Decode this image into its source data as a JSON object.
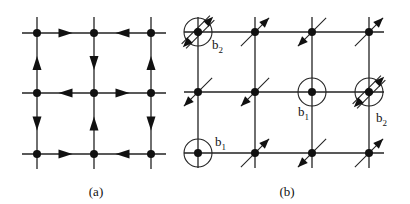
{
  "figure": {
    "panels": [
      {
        "id": "a",
        "caption": "(a)",
        "grid": {
          "cols_x": [
            37,
            94,
            151
          ],
          "rows_y": [
            33,
            93,
            154
          ],
          "line_extent_x": [
            22,
            166
          ],
          "line_extent_y": [
            17,
            169
          ]
        },
        "edges": [
          {
            "from": [
              0,
              0
            ],
            "to": [
              1,
              0
            ],
            "dir": "right"
          },
          {
            "from": [
              1,
              0
            ],
            "to": [
              2,
              0
            ],
            "dir": "left"
          },
          {
            "from": [
              0,
              1
            ],
            "to": [
              1,
              1
            ],
            "dir": "left"
          },
          {
            "from": [
              1,
              1
            ],
            "to": [
              2,
              1
            ],
            "dir": "right"
          },
          {
            "from": [
              0,
              2
            ],
            "to": [
              1,
              2
            ],
            "dir": "right"
          },
          {
            "from": [
              1,
              2
            ],
            "to": [
              2,
              2
            ],
            "dir": "left"
          },
          {
            "from": [
              0,
              0
            ],
            "to": [
              0,
              1
            ],
            "dir": "up"
          },
          {
            "from": [
              0,
              1
            ],
            "to": [
              0,
              2
            ],
            "dir": "down"
          },
          {
            "from": [
              1,
              0
            ],
            "to": [
              1,
              1
            ],
            "dir": "down"
          },
          {
            "from": [
              1,
              1
            ],
            "to": [
              1,
              2
            ],
            "dir": "up"
          },
          {
            "from": [
              2,
              0
            ],
            "to": [
              2,
              1
            ],
            "dir": "up"
          },
          {
            "from": [
              2,
              1
            ],
            "to": [
              2,
              2
            ],
            "dir": "down"
          }
        ]
      },
      {
        "id": "b",
        "caption": "(b)",
        "grid": {
          "cols_x": [
            198,
            255,
            312,
            369
          ],
          "rows_y": [
            32,
            92,
            153
          ],
          "line_extent_x": [
            184,
            384
          ],
          "line_extent_y": [
            17,
            168
          ]
        },
        "sites": [
          {
            "col": 0,
            "row": 0,
            "spin": "both",
            "circled": true,
            "label": "b2"
          },
          {
            "col": 1,
            "row": 0,
            "spin": "ne"
          },
          {
            "col": 2,
            "row": 0,
            "spin": "sw"
          },
          {
            "col": 3,
            "row": 0,
            "spin": "ne"
          },
          {
            "col": 0,
            "row": 1,
            "spin": "sw"
          },
          {
            "col": 1,
            "row": 1,
            "spin": "sw"
          },
          {
            "col": 2,
            "row": 1,
            "spin": "none",
            "circled": true,
            "label": "b1"
          },
          {
            "col": 3,
            "row": 1,
            "spin": "both",
            "circled": true,
            "label": "b2"
          },
          {
            "col": 0,
            "row": 2,
            "spin": "none",
            "circled": true,
            "label": "b1"
          },
          {
            "col": 1,
            "row": 2,
            "spin": "ne"
          },
          {
            "col": 2,
            "row": 2,
            "spin": "sw"
          },
          {
            "col": 3,
            "row": 2,
            "spin": "ne"
          }
        ],
        "labels": [
          {
            "text": "b",
            "sub": "2",
            "x": 212,
            "y": 49
          },
          {
            "text": "b",
            "sub": "1",
            "x": 298,
            "y": 116
          },
          {
            "text": "b",
            "sub": "2",
            "x": 376,
            "y": 122
          },
          {
            "text": "b",
            "sub": "1",
            "x": 215,
            "y": 146
          }
        ]
      }
    ],
    "caption_positions": {
      "a": {
        "x": 96,
        "y": 196
      },
      "b": {
        "x": 287,
        "y": 196
      }
    },
    "colors": {
      "line": "#222222",
      "node": "#111111",
      "background": "#ffffff"
    }
  }
}
